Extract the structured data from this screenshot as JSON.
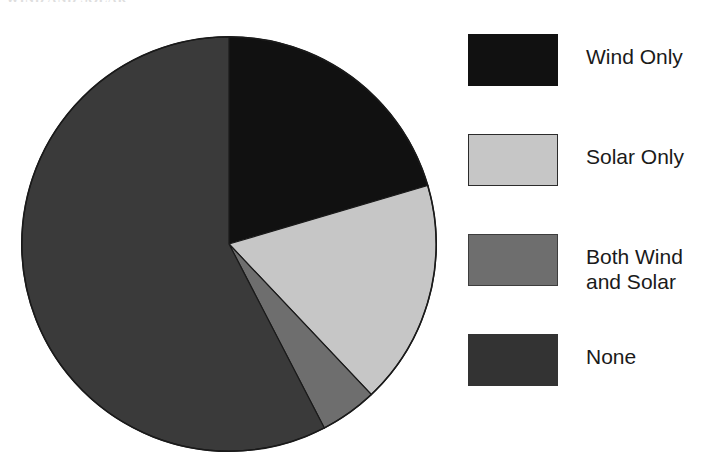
{
  "figure": {
    "top_caption_fragment": "WIND AND SOLAR",
    "background_color": "#ffffff"
  },
  "chart_data": {
    "type": "pie",
    "title": "",
    "subtitle": "",
    "xlabel": "",
    "ylabel": "",
    "legend_position": "right",
    "grid": false,
    "start_angle_deg": 0,
    "direction": "clockwise",
    "categories": [
      "Wind Only",
      "Solar Only",
      "Both Wind and Solar",
      "None"
    ],
    "values": [
      20.4,
      17.5,
      4.4,
      57.7
    ],
    "value_unit": "percent",
    "slices": [
      {
        "label": "Wind Only",
        "value": 20.4,
        "start_angle_deg": 0.0,
        "end_angle_deg": 73.6,
        "color": "#111111"
      },
      {
        "label": "Solar Only",
        "value": 17.5,
        "start_angle_deg": 73.6,
        "end_angle_deg": 136.6,
        "color": "#c6c6c6"
      },
      {
        "label": "Both Wind and Solar",
        "value": 4.4,
        "start_angle_deg": 136.6,
        "end_angle_deg": 152.6,
        "color": "#6e6e6e"
      },
      {
        "label": "None",
        "value": 57.7,
        "start_angle_deg": 152.6,
        "end_angle_deg": 360.0,
        "color": "#3a3a3a"
      }
    ],
    "outline_color": "#1a1a1a"
  },
  "legend": {
    "items": [
      {
        "label": "Wind Only",
        "color": "#111111",
        "border": "#111111"
      },
      {
        "label": "Solar Only",
        "color": "#c6c6c6",
        "border": "#2b2b2b"
      },
      {
        "label": "Both Wind\nand Solar",
        "color": "#6e6e6e",
        "border": "#3d3d3d"
      },
      {
        "label": "None",
        "color": "#333333",
        "border": "#333333"
      }
    ]
  }
}
